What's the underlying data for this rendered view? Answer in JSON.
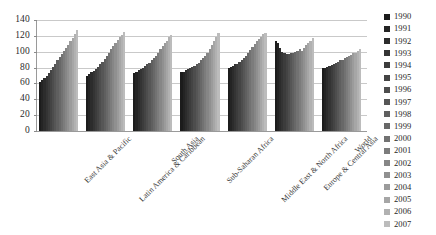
{
  "chart_data": {
    "type": "bar",
    "title": "",
    "subtitle": "",
    "xlabel": "",
    "ylabel": "",
    "ylim": [
      0,
      140
    ],
    "ytick_step": 20,
    "ytick_labels": [
      "140",
      "120",
      "100",
      "80",
      "60",
      "40",
      "20",
      "0"
    ],
    "ytick_values": [
      140,
      120,
      100,
      80,
      60,
      40,
      20,
      0
    ],
    "grid": true,
    "legend_position": "right",
    "orientation": "vertical",
    "grouping": "clustered",
    "categories": [
      "East Asia & Pacific",
      "Latin America & Caribbean",
      "South Asia",
      "Sub-Saharan Africa",
      "Middle East & North Africa",
      "Europe & Central Asia",
      "World"
    ],
    "series": [
      {
        "name": "1990",
        "color": "#1c1c1c",
        "values": [
          62,
          70,
          73,
          74,
          80,
          114,
          79
        ]
      },
      {
        "name": "1991",
        "color": "#242424",
        "values": [
          64,
          72,
          75,
          75,
          81,
          111,
          80
        ]
      },
      {
        "name": "1992",
        "color": "#2c2c2c",
        "values": [
          67,
          74,
          77,
          77,
          82,
          105,
          81
        ]
      },
      {
        "name": "1993",
        "color": "#343434",
        "values": [
          70,
          76,
          78,
          78,
          84,
          100,
          82
        ]
      },
      {
        "name": "1994",
        "color": "#3c3c3c",
        "values": [
          73,
          78,
          80,
          79,
          85,
          98,
          83
        ]
      },
      {
        "name": "1995",
        "color": "#444444",
        "values": [
          77,
          81,
          82,
          81,
          87,
          97,
          84
        ]
      },
      {
        "name": "1996",
        "color": "#4d4d4d",
        "values": [
          81,
          84,
          84,
          82,
          89,
          97,
          86
        ]
      },
      {
        "name": "1997",
        "color": "#565656",
        "values": [
          85,
          87,
          86,
          84,
          92,
          98,
          87
        ]
      },
      {
        "name": "1998",
        "color": "#5f5f5f",
        "values": [
          89,
          91,
          89,
          86,
          95,
          99,
          89
        ]
      },
      {
        "name": "1999",
        "color": "#686868",
        "values": [
          93,
          95,
          92,
          89,
          98,
          100,
          90
        ]
      },
      {
        "name": "2000",
        "color": "#727272",
        "values": [
          97,
          99,
          95,
          92,
          102,
          101,
          92
        ]
      },
      {
        "name": "2001",
        "color": "#7c7c7c",
        "values": [
          101,
          103,
          99,
          95,
          106,
          104,
          93
        ]
      },
      {
        "name": "2002",
        "color": "#868686",
        "values": [
          105,
          107,
          103,
          99,
          110,
          101,
          95
        ]
      },
      {
        "name": "2003",
        "color": "#909090",
        "values": [
          109,
          111,
          107,
          103,
          113,
          105,
          96
        ]
      },
      {
        "name": "2004",
        "color": "#9b9b9b",
        "values": [
          113,
          115,
          111,
          108,
          116,
          108,
          98
        ]
      },
      {
        "name": "2005",
        "color": "#a6a6a6",
        "values": [
          117,
          118,
          114,
          113,
          119,
          111,
          99
        ]
      },
      {
        "name": "2006",
        "color": "#b1b1b1",
        "values": [
          122,
          121,
          118,
          119,
          122,
          114,
          101
        ]
      },
      {
        "name": "2007",
        "color": "#bcbcbc",
        "values": [
          127,
          125,
          121,
          124,
          124,
          117,
          103
        ]
      }
    ]
  }
}
